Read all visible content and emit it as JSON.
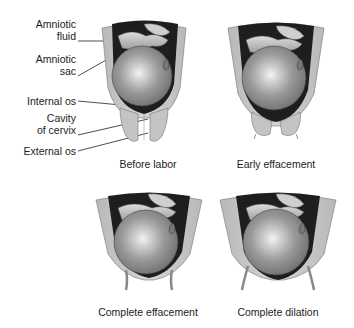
{
  "diagram": {
    "labels": {
      "amniotic_fluid_l1": "Amniotic",
      "amniotic_fluid_l2": "fluid",
      "amniotic_sac_l1": "Amniotic",
      "amniotic_sac_l2": "sac",
      "internal_os": "Internal os",
      "cavity_of_cervix_l1": "Cavity",
      "cavity_of_cervix_l2": "of cervix",
      "external_os": "External os"
    },
    "panels": [
      {
        "caption": "Before labor",
        "stage": "before-labor"
      },
      {
        "caption": "Early effacement",
        "stage": "early-effacement"
      },
      {
        "caption": "Complete effacement",
        "stage": "complete-effacement"
      },
      {
        "caption": "Complete dilation",
        "stage": "complete-dilation"
      }
    ],
    "colors": {
      "uterine_wall": "#c8c8c8",
      "cavity_dark": "#1e1e1e",
      "fetal_head": "#8e8e8e",
      "highlight": "#f2f2f2",
      "cervix": "#bdbdbd",
      "text": "#1c1c1c"
    }
  }
}
